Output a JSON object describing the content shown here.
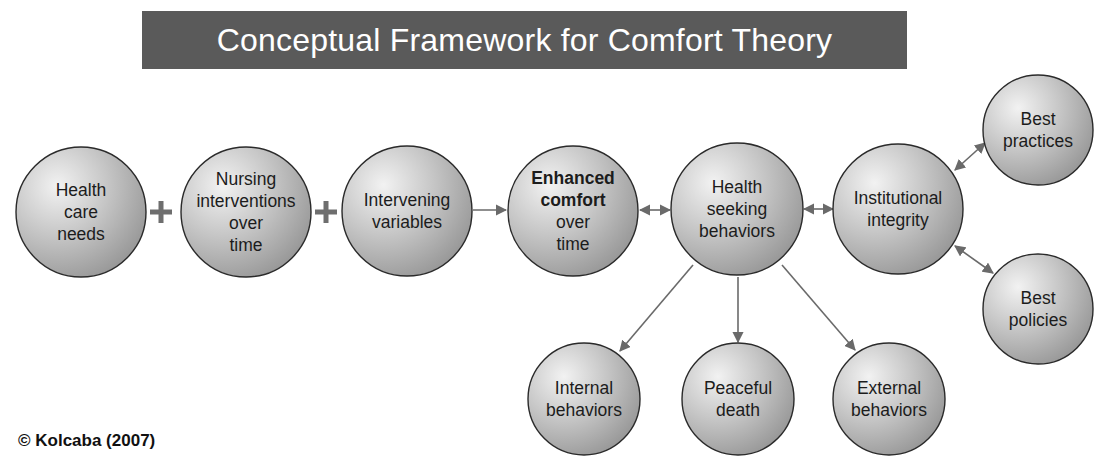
{
  "title": "Conceptual Framework for Comfort Theory",
  "copyright": "© Kolcaba (2007)",
  "colors": {
    "title_bg": "#5a5a5a",
    "node_light": "#f2f2f2",
    "node_mid": "#bdbdbd",
    "node_dark": "#8e8e8e",
    "node_stroke": "#2a2a2a",
    "arrow": "#6a6a6a",
    "plus": "#6e6e6e"
  },
  "nodes": [
    {
      "id": "health-care-needs",
      "cx": 81,
      "cy": 212,
      "r": 65,
      "lines": [
        "Health",
        "care",
        "needs"
      ],
      "bold_lines": 0
    },
    {
      "id": "nursing-interventions",
      "cx": 246,
      "cy": 212,
      "r": 65,
      "lines": [
        "Nursing",
        "interventions",
        "over",
        "time"
      ],
      "bold_lines": 0
    },
    {
      "id": "intervening-variables",
      "cx": 407,
      "cy": 211,
      "r": 65,
      "lines": [
        "Intervening",
        "variables"
      ],
      "bold_lines": 0
    },
    {
      "id": "enhanced-comfort",
      "cx": 573,
      "cy": 211,
      "r": 65,
      "lines": [
        "Enhanced",
        "comfort",
        "over",
        "time"
      ],
      "bold_lines": 2
    },
    {
      "id": "health-seeking-behaviors",
      "cx": 737,
      "cy": 209,
      "r": 66,
      "lines": [
        "Health",
        "seeking",
        "behaviors"
      ],
      "bold_lines": 0
    },
    {
      "id": "institutional-integrity",
      "cx": 898,
      "cy": 209,
      "r": 65,
      "lines": [
        "Institutional",
        "integrity"
      ],
      "bold_lines": 0
    },
    {
      "id": "best-practices",
      "cx": 1038,
      "cy": 130,
      "r": 55,
      "lines": [
        "Best",
        "practices"
      ],
      "bold_lines": 0
    },
    {
      "id": "best-policies",
      "cx": 1038,
      "cy": 309,
      "r": 55,
      "lines": [
        "Best",
        "policies"
      ],
      "bold_lines": 0
    },
    {
      "id": "internal-behaviors",
      "cx": 584,
      "cy": 399,
      "r": 56,
      "lines": [
        "Internal",
        "behaviors"
      ],
      "bold_lines": 0
    },
    {
      "id": "peaceful-death",
      "cx": 738,
      "cy": 399,
      "r": 56,
      "lines": [
        "Peaceful",
        "death"
      ],
      "bold_lines": 0
    },
    {
      "id": "external-behaviors",
      "cx": 889,
      "cy": 399,
      "r": 56,
      "lines": [
        "External",
        "behaviors"
      ],
      "bold_lines": 0
    }
  ],
  "operators": [
    {
      "symbol": "+",
      "x": 161,
      "y": 212
    },
    {
      "symbol": "+",
      "x": 326,
      "y": 212
    }
  ],
  "edges": [
    {
      "from": "intervening-variables",
      "to": "enhanced-comfort",
      "x1": 473,
      "y1": 210,
      "x2": 506,
      "y2": 210,
      "bidirectional": false
    },
    {
      "from": "enhanced-comfort",
      "to": "health-seeking-behaviors",
      "x1": 640,
      "y1": 210,
      "x2": 670,
      "y2": 210,
      "bidirectional": true
    },
    {
      "from": "health-seeking-behaviors",
      "to": "institutional-integrity",
      "x1": 804,
      "y1": 209,
      "x2": 833,
      "y2": 209,
      "bidirectional": true
    },
    {
      "from": "institutional-integrity",
      "to": "best-practices",
      "x1": 955,
      "y1": 170,
      "x2": 985,
      "y2": 143,
      "bidirectional": true
    },
    {
      "from": "institutional-integrity",
      "to": "best-policies",
      "x1": 955,
      "y1": 246,
      "x2": 993,
      "y2": 273,
      "bidirectional": true
    },
    {
      "from": "health-seeking-behaviors",
      "to": "internal-behaviors",
      "x1": 693,
      "y1": 265,
      "x2": 620,
      "y2": 351,
      "bidirectional": false
    },
    {
      "from": "health-seeking-behaviors",
      "to": "peaceful-death",
      "x1": 738,
      "y1": 277,
      "x2": 738,
      "y2": 342,
      "bidirectional": false
    },
    {
      "from": "health-seeking-behaviors",
      "to": "external-behaviors",
      "x1": 782,
      "y1": 265,
      "x2": 855,
      "y2": 350,
      "bidirectional": false
    }
  ]
}
